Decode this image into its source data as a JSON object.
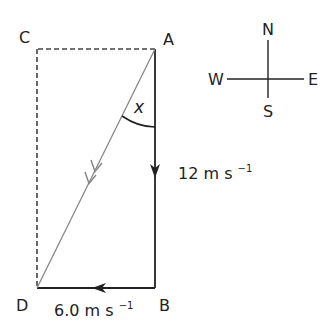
{
  "diagram": {
    "points": {
      "A": {
        "label": "A",
        "x": 155,
        "y": 49
      },
      "B": {
        "label": "B",
        "x": 155,
        "y": 288
      },
      "C": {
        "label": "C",
        "x": 37,
        "y": 49
      },
      "D": {
        "label": "D",
        "x": 37,
        "y": 288
      }
    },
    "angle_label": "x",
    "vectors": {
      "south": {
        "from": "A",
        "to": "B",
        "magnitude": "12",
        "unit": "m s",
        "exp": "−1",
        "color": "#222222"
      },
      "west": {
        "from": "B",
        "to": "D",
        "magnitude": "6.0",
        "unit": "m s",
        "exp": "−1",
        "color": "#222222"
      },
      "resultant": {
        "from": "A",
        "to": "D",
        "color": "#888888"
      }
    },
    "construction_lines": {
      "style": "dashed",
      "color": "#444444"
    },
    "compass": {
      "north": "N",
      "south": "S",
      "east": "E",
      "west": "W"
    }
  }
}
